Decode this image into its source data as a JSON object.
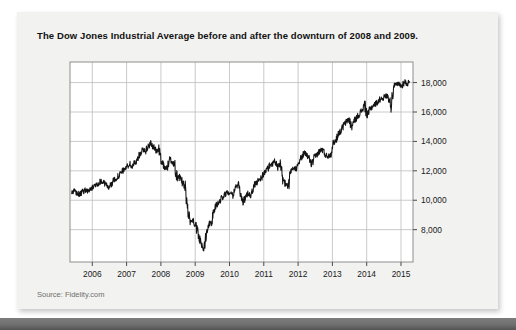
{
  "card": {
    "title": "The Dow Jones Industrial Average before and after the downturn of 2008 and 2009.",
    "source": "Source: Fidelity.com",
    "background_color": "#f2f2f0"
  },
  "chart_data": {
    "type": "line",
    "title": "The Dow Jones Industrial Average before and after the downturn of 2008 and 2009.",
    "xlabel": "",
    "ylabel": "",
    "source": "Source: Fidelity.com",
    "grid": true,
    "legend": null,
    "line_color": "#141414",
    "xlim": [
      2005.35,
      2015.35
    ],
    "ylim": [
      5800,
      19400
    ],
    "xticks": [
      2006,
      2007,
      2008,
      2009,
      2010,
      2011,
      2012,
      2013,
      2014,
      2015
    ],
    "xtick_labels": [
      "2006",
      "2007",
      "2008",
      "2009",
      "2010",
      "2011",
      "2012",
      "2013",
      "2014",
      "2015"
    ],
    "yticks": [
      8000,
      10000,
      12000,
      14000,
      16000,
      18000
    ],
    "ytick_labels": [
      "8,000",
      "10,000",
      "12,000",
      "14,000",
      "16,000",
      "18,000"
    ],
    "annotations": [
      {
        "text": "peak before downturn",
        "x": 2007.76,
        "y": 14100
      },
      {
        "text": "downturn trough",
        "x": 2009.18,
        "y": 6550
      },
      {
        "text": "recovery high",
        "x": 2015.05,
        "y": 18200
      }
    ],
    "series": [
      {
        "name": "Dow Jones Industrial Average",
        "x": [
          2005.4,
          2005.48,
          2005.56,
          2005.63,
          2005.71,
          2005.79,
          2005.86,
          2005.94,
          2006.02,
          2006.1,
          2006.17,
          2006.25,
          2006.33,
          2006.4,
          2006.48,
          2006.56,
          2006.63,
          2006.71,
          2006.79,
          2006.86,
          2006.94,
          2007.02,
          2007.1,
          2007.17,
          2007.25,
          2007.33,
          2007.4,
          2007.48,
          2007.56,
          2007.63,
          2007.71,
          2007.79,
          2007.86,
          2007.94,
          2008.02,
          2008.1,
          2008.17,
          2008.25,
          2008.33,
          2008.4,
          2008.48,
          2008.56,
          2008.63,
          2008.71,
          2008.79,
          2008.86,
          2008.94,
          2009.02,
          2009.1,
          2009.17,
          2009.25,
          2009.33,
          2009.4,
          2009.48,
          2009.56,
          2009.63,
          2009.71,
          2009.79,
          2009.86,
          2009.94,
          2010.02,
          2010.1,
          2010.17,
          2010.25,
          2010.33,
          2010.4,
          2010.48,
          2010.56,
          2010.63,
          2010.71,
          2010.79,
          2010.86,
          2010.94,
          2011.02,
          2011.1,
          2011.17,
          2011.25,
          2011.33,
          2011.4,
          2011.48,
          2011.56,
          2011.63,
          2011.71,
          2011.79,
          2011.86,
          2011.94,
          2012.02,
          2012.1,
          2012.17,
          2012.25,
          2012.33,
          2012.4,
          2012.48,
          2012.56,
          2012.63,
          2012.71,
          2012.79,
          2012.86,
          2012.94,
          2013.02,
          2013.1,
          2013.17,
          2013.25,
          2013.33,
          2013.4,
          2013.48,
          2013.56,
          2013.63,
          2013.71,
          2013.79,
          2013.86,
          2013.94,
          2014.02,
          2014.1,
          2014.17,
          2014.25,
          2014.33,
          2014.4,
          2014.48,
          2014.56,
          2014.63,
          2014.71,
          2014.79,
          2014.86,
          2014.94,
          2015.02,
          2015.1,
          2015.17,
          2015.25
        ],
        "values": [
          10450,
          10600,
          10480,
          10350,
          10550,
          10700,
          10620,
          10720,
          10880,
          11050,
          11150,
          11300,
          11200,
          11050,
          10900,
          11100,
          11350,
          11550,
          11700,
          11900,
          12150,
          12300,
          12450,
          12250,
          12600,
          12800,
          13200,
          13500,
          13350,
          13650,
          13900,
          13600,
          13350,
          13400,
          12700,
          12300,
          12100,
          12800,
          12650,
          12400,
          11400,
          11600,
          11200,
          10800,
          9200,
          8600,
          8600,
          8200,
          7600,
          7000,
          6700,
          7900,
          8400,
          8600,
          9400,
          9700,
          9900,
          10200,
          10400,
          10500,
          10600,
          10400,
          10900,
          11000,
          10400,
          9900,
          10200,
          10500,
          10300,
          11000,
          11200,
          11400,
          11550,
          11900,
          12100,
          12350,
          12500,
          12700,
          12200,
          12400,
          11400,
          11100,
          10900,
          11900,
          12100,
          12200,
          12650,
          12900,
          13200,
          13100,
          12800,
          12400,
          12900,
          13150,
          13350,
          13450,
          13100,
          13000,
          13100,
          13900,
          14050,
          14550,
          14700,
          15100,
          15300,
          15550,
          14950,
          15400,
          15600,
          15900,
          16100,
          16500,
          15700,
          16200,
          16400,
          16550,
          16700,
          16900,
          16950,
          17100,
          17050,
          16500,
          17800,
          17850,
          17900,
          17750,
          18100,
          17900,
          18050
        ]
      }
    ]
  },
  "axis": {
    "y_labels": [
      "18,000",
      "16,000",
      "14,000",
      "12,000",
      "10,000",
      "8,000"
    ],
    "x_labels": [
      "2006",
      "2007",
      "2008",
      "2009",
      "2010",
      "2011",
      "2012",
      "2013",
      "2014",
      "2015"
    ]
  }
}
